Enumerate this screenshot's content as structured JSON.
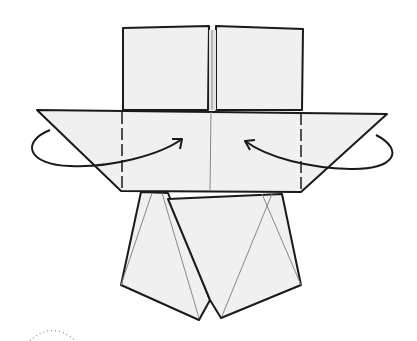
{
  "diagram": {
    "type": "origami-step",
    "colors": {
      "paper": "#f0f0f0",
      "outline": "#1a1a1a",
      "crease": "#888888",
      "dotted_arc": "#999999",
      "background": "#ffffff"
    },
    "arrows": [
      {
        "id": "left-fold-arrow",
        "direction": "fold behind, toward center",
        "side": "left"
      },
      {
        "id": "right-fold-arrow",
        "direction": "fold behind, toward center",
        "side": "right"
      }
    ],
    "annotations": [
      {
        "id": "dotted-arc",
        "description": "partial dotted arc at bottom-left"
      }
    ]
  }
}
